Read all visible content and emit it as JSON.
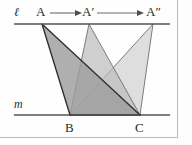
{
  "figure": {
    "lines": {
      "top": {
        "label": "ℓ",
        "name": "line-ell",
        "y": 24,
        "x1": 14,
        "x2": 170
      },
      "bottom": {
        "label": "m",
        "name": "line-m",
        "y": 115,
        "x1": 14,
        "x2": 170
      }
    },
    "points": [
      {
        "id": "A",
        "label": "A",
        "prime": "",
        "x": 42,
        "y": 24
      },
      {
        "id": "A1",
        "label": "A",
        "prime": "′",
        "x": 89,
        "y": 24
      },
      {
        "id": "A2",
        "label": "A",
        "prime": "″",
        "x": 153,
        "y": 24
      },
      {
        "id": "B",
        "label": "B",
        "prime": "",
        "x": 70,
        "y": 115
      },
      {
        "id": "C",
        "label": "C",
        "prime": "",
        "x": 140,
        "y": 115
      }
    ],
    "point_labels": {
      "A": {
        "text": "A",
        "x": 37,
        "y": 7
      },
      "A1": {
        "text": "A′",
        "x": 83,
        "y": 7
      },
      "A2": {
        "text": "A″",
        "x": 147,
        "y": 7
      },
      "B": {
        "text": "B",
        "x": 65,
        "y": 123
      },
      "C": {
        "text": "C",
        "x": 135,
        "y": 123
      }
    },
    "line_labels": {
      "ell": {
        "text": "ℓ",
        "x": 16,
        "y": 8
      },
      "m": {
        "text": "m",
        "x": 16,
        "y": 100
      }
    },
    "arrows": [
      {
        "name": "arrow-a-to-aprime",
        "x1": 50,
        "x2": 80,
        "y": 13
      },
      {
        "name": "arrow-aprime-to-adoubleprime",
        "x1": 97,
        "x2": 143,
        "y": 13
      }
    ],
    "triangles": [
      {
        "name": "triangle-abc",
        "apex": "A",
        "fill": "#9d9d9d",
        "opacity": 0.85,
        "stroke": "#2f2f2f",
        "stroke_width": 1.3
      },
      {
        "name": "triangle-a1bc",
        "apex": "A1",
        "fill": "#bcbcbc",
        "opacity": 0.72,
        "stroke": "#6a6a6a",
        "stroke_width": 0.9
      },
      {
        "name": "triangle-a2bc",
        "apex": "A2",
        "fill": "#c9c9c9",
        "opacity": 0.6,
        "stroke": "#6a6a6a",
        "stroke_width": 0.9
      }
    ],
    "colors": {
      "background": "#fdfdfd",
      "frame": "#b9b9b9",
      "line": "#555555",
      "label": "#2b2b2b",
      "arrow": "#6b6b6b",
      "fill_dark": "#9d9d9d",
      "fill_mid": "#bcbcbc",
      "fill_light": "#c9c9c9"
    }
  }
}
